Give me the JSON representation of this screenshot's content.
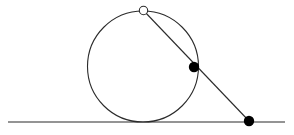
{
  "figure": {
    "width": 294,
    "height": 135,
    "background_color": "#ffffff",
    "stroke_color": "#2b2b2b",
    "marker_fill_color": "#000000",
    "marker_hollow_fill_color": "#ffffff"
  },
  "chart_data": {
    "type": "scatter",
    "title": "",
    "xlabel": "",
    "ylabel": "",
    "grid": false,
    "legend": "none",
    "xlim": [
      0,
      294
    ],
    "ylim": [
      135,
      0
    ],
    "shapes": [
      {
        "id": "baseline",
        "kind": "line",
        "label": "horizontal baseline",
        "x1": 8,
        "y1": 122,
        "x2": 285,
        "y2": 122,
        "stroke": "#2b2b2b",
        "stroke_width": 1.1
      },
      {
        "id": "circle",
        "kind": "circle",
        "label": "circle tangent to baseline",
        "cx": 143,
        "cy": 66.5,
        "r": 55.5,
        "stroke": "#2b2b2b",
        "stroke_width": 1.1,
        "fill": "none"
      },
      {
        "id": "secant",
        "kind": "line",
        "label": "secant from top point through circle to baseline point",
        "x1": 143.5,
        "y1": 10.5,
        "x2": 249,
        "y2": 121,
        "stroke": "#2b2b2b",
        "stroke_width": 1.1
      }
    ],
    "points": [
      {
        "id": "point-top",
        "label": "open point at top of circle",
        "x": 143.5,
        "y": 10.5,
        "marker": "open-circle",
        "radius": 4.2,
        "fill": "#ffffff",
        "stroke": "#2b2b2b",
        "stroke_width": 1.1
      },
      {
        "id": "point-on-circle",
        "label": "filled point on right of circle",
        "x": 194,
        "y": 67,
        "marker": "filled-circle",
        "radius": 5.2,
        "fill": "#000000",
        "stroke": "#000000",
        "stroke_width": 0
      },
      {
        "id": "point-on-baseline",
        "label": "filled point on baseline",
        "x": 249,
        "y": 121,
        "marker": "filled-circle",
        "radius": 5.2,
        "fill": "#000000",
        "stroke": "#000000",
        "stroke_width": 0
      }
    ]
  }
}
